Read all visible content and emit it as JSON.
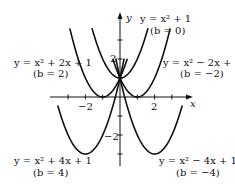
{
  "chart_data": {
    "type": "line",
    "title": "",
    "xlabel": "x",
    "ylabel": "y",
    "xlim": [
      -4,
      4
    ],
    "ylim": [
      -3.5,
      4.4
    ],
    "grid": false,
    "x_ticks": [
      -3,
      -2,
      -1,
      1,
      2,
      3
    ],
    "y_ticks": [
      -3,
      -2,
      -1,
      1,
      2,
      3
    ],
    "x_tick_labels": [
      {
        "value": -2,
        "text": "−2"
      },
      {
        "value": 2,
        "text": "2"
      }
    ],
    "y_tick_labels": [
      {
        "value": 2,
        "text": "2"
      },
      {
        "value": -2,
        "text": "−2"
      }
    ],
    "series": [
      {
        "name": "y = x² + 1",
        "b": 0,
        "formula": "y = x^2 + 1",
        "label": "y = x² + 1",
        "b_label": "(b = 0)",
        "x_range": [
          -1.62,
          1.62
        ]
      },
      {
        "name": "y = x² + 2x + 1",
        "b": 2,
        "formula": "y = x^2 + 2x + 1",
        "label": "y = x² + 2x + 1",
        "b_label": "(b = 2)",
        "x_range": [
          -2.9,
          0.42
        ]
      },
      {
        "name": "y = x² − 2x + 1",
        "b": -2,
        "formula": "y = x^2 - 2x + 1",
        "label": "y = x² − 2x + 1",
        "b_label": "(b = −2)",
        "x_range": [
          -0.42,
          2.9
        ]
      },
      {
        "name": "y = x² + 4x + 1",
        "b": 4,
        "formula": "y = x^2 + 4x + 1",
        "label": "y = x² + 4x + 1",
        "b_label": "(b = 4)",
        "x_range": [
          -3.6,
          0.24
        ]
      },
      {
        "name": "y = x² − 4x + 1",
        "b": -4,
        "formula": "y = x^2 - 4x + 1",
        "label": "y = x² − 4x + 1",
        "b_label": "(b = −4)",
        "x_range": [
          -0.24,
          3.6
        ]
      }
    ],
    "annotations": [
      {
        "text": "y = x² + 1",
        "sub": "(b = 0)",
        "position": "top-right of y-axis"
      },
      {
        "text": "y = x² + 2x + 1",
        "sub": "(b = 2)",
        "position": "upper-left"
      },
      {
        "text": "y = x² − 2x + 1",
        "sub": "(b = −2)",
        "position": "upper-right"
      },
      {
        "text": "y = x² + 4x + 1",
        "sub": "(b = 4)",
        "position": "lower-left"
      },
      {
        "text": "y = x² − 4x + 1",
        "sub": "(b = −4)",
        "position": "lower-right"
      }
    ]
  },
  "labels": {
    "y_axis": "y",
    "x_axis": "x",
    "tick_x_neg2": "−2",
    "tick_x_2": "2",
    "tick_y_2": "2",
    "tick_y_neg2": "−2",
    "b0_eq": "y = x² + 1",
    "b0_b": "(b = 0)",
    "b2_eq": "y = x² + 2x + 1",
    "b2_b": "(b = 2)",
    "bm2_eq": "y = x² − 2x + 1",
    "bm2_b": "(b = −2)",
    "b4_eq": "y = x² + 4x + 1",
    "b4_b": "(b = 4)",
    "bm4_eq": "y = x² − 4x + 1",
    "bm4_b": "(b = −4)"
  }
}
